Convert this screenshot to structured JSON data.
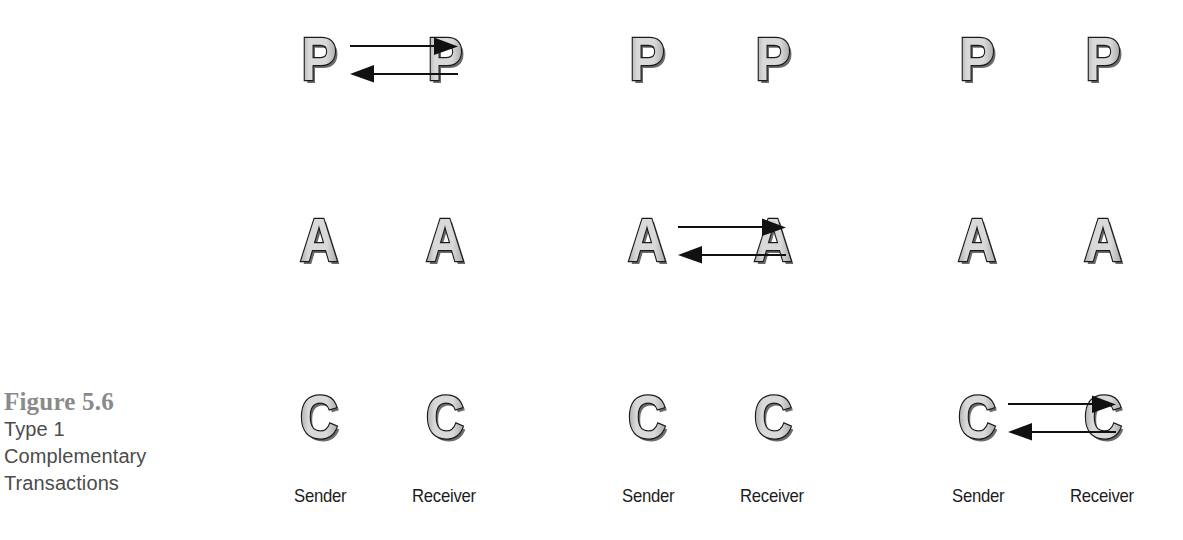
{
  "caption": {
    "figure_number": "Figure 5.6",
    "lines": [
      "Type 1",
      "Complementary",
      "Transactions"
    ]
  },
  "legend": {
    "sender_label": "Sender",
    "receiver_label": "Receiver"
  },
  "ego_states": {
    "parent": "P",
    "adult": "A",
    "child": "C"
  },
  "colors": {
    "letter_fill_light": "#d9d9d9",
    "letter_fill_dark": "#a8a8a8",
    "letter_outline": "#1a1a1a",
    "letter_shadow": "#6b6b6b",
    "arrow": "#111111",
    "caption_number": "#8a8a8a",
    "caption_text": "#4c4c4c",
    "background": "#ffffff"
  },
  "diagrams": [
    {
      "name": "parent-to-parent-transaction",
      "rows": [
        {
          "state": "P",
          "sender": "P",
          "receiver": "P",
          "arrows": true
        },
        {
          "state": "A",
          "sender": "A",
          "receiver": "A",
          "arrows": false
        },
        {
          "state": "C",
          "sender": "C",
          "receiver": "C",
          "arrows": false
        }
      ],
      "sender": "Sender",
      "receiver": "Receiver"
    },
    {
      "name": "adult-to-adult-transaction",
      "rows": [
        {
          "state": "P",
          "sender": "P",
          "receiver": "P",
          "arrows": false
        },
        {
          "state": "A",
          "sender": "A",
          "receiver": "A",
          "arrows": true
        },
        {
          "state": "C",
          "sender": "C",
          "receiver": "C",
          "arrows": false
        }
      ],
      "sender": "Sender",
      "receiver": "Receiver"
    },
    {
      "name": "child-to-child-transaction",
      "rows": [
        {
          "state": "P",
          "sender": "P",
          "receiver": "P",
          "arrows": false
        },
        {
          "state": "A",
          "sender": "A",
          "receiver": "A",
          "arrows": false
        },
        {
          "state": "C",
          "sender": "C",
          "receiver": "C",
          "arrows": true
        }
      ],
      "sender": "Sender",
      "receiver": "Receiver"
    }
  ],
  "arrow_directions": {
    "stimulus": "right",
    "response": "left"
  }
}
